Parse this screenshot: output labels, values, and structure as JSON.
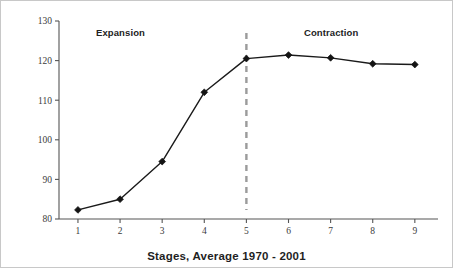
{
  "chart_data": {
    "type": "line",
    "title": "",
    "xlabel": "Stages, Average 1970 - 2001",
    "ylabel": "Cycle Relatives",
    "x": [
      1,
      2,
      3,
      4,
      5,
      6,
      7,
      8,
      9
    ],
    "values": [
      82.3,
      85.0,
      94.5,
      112.0,
      120.5,
      121.4,
      120.7,
      119.2,
      119.0
    ],
    "series": [
      {
        "name": "Cycle Relatives",
        "values": [
          82.3,
          85.0,
          94.5,
          112.0,
          120.5,
          121.4,
          120.7,
          119.2,
          119.0
        ]
      }
    ],
    "xlim": [
      0.55,
      9.55
    ],
    "ylim": [
      80,
      130
    ],
    "xticks": [
      "1",
      "2",
      "3",
      "4",
      "5",
      "6",
      "7",
      "8",
      "9"
    ],
    "yticks": [
      "80",
      "90",
      "100",
      "110",
      "120",
      "130"
    ],
    "grid": false,
    "legend": "none",
    "marker": "diamond",
    "line_color": "#1a1a1a",
    "marker_color": "#141414",
    "annotations": [
      {
        "id": "expansion",
        "text": "Expansion",
        "x_px": 95,
        "y_px": 26
      },
      {
        "id": "contraction",
        "text": "Contraction",
        "x_px": 303,
        "y_px": 26
      }
    ],
    "reference_lines": [
      {
        "id": "cycle-peak-divider",
        "orientation": "vertical",
        "x": 5,
        "style": "dashed",
        "color": "#9b9b9b"
      }
    ]
  }
}
